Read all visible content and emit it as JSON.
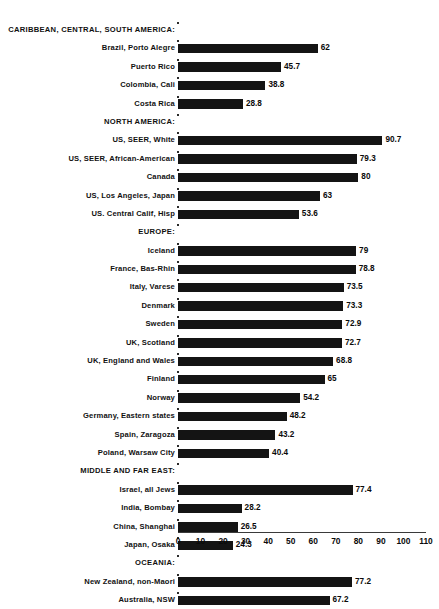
{
  "chart_data": {
    "type": "bar",
    "orientation": "horizontal",
    "title": "",
    "subtitle": "",
    "xlabel": "",
    "ylabel": "",
    "xlim": [
      0,
      110
    ],
    "xticks": [
      0,
      10,
      20,
      30,
      40,
      50,
      60,
      70,
      80,
      90,
      100,
      110
    ],
    "grid": false,
    "legend": "none",
    "bar_color": "#141414",
    "background_color": "#ffffff",
    "groups": [
      {
        "header": "CARIBBEAN, CENTRAL, SOUTH AMERICA:",
        "categories": [
          "Brazil, Porto Alegre",
          "Puerto Rico",
          "Colombia, Cali",
          "Costa Rica"
        ],
        "values": [
          62,
          45.7,
          38.8,
          28.8
        ],
        "value_labels": [
          "62",
          "45.7",
          "38.8",
          "28.8"
        ]
      },
      {
        "header": "NORTH AMERICA:",
        "categories": [
          "US, SEER, White",
          "US, SEER, African-American",
          "Canada",
          "US, Los Angeles, Japan",
          "US. Central Calif, Hisp"
        ],
        "values": [
          90.7,
          79.3,
          80,
          63,
          53.6
        ],
        "value_labels": [
          "90.7",
          "79.3",
          "80",
          "63",
          "53.6"
        ]
      },
      {
        "header": "EUROPE:",
        "categories": [
          "Iceland",
          "France, Bas-Rhin",
          "Italy, Varese",
          "Denmark",
          "Sweden",
          "UK, Scotland",
          "UK, England and Wales",
          "Finland",
          "Norway",
          "Germany, Eastern states",
          "Spain, Zaragoza",
          "Poland, Warsaw City"
        ],
        "values": [
          79,
          78.8,
          73.5,
          73.3,
          72.9,
          72.7,
          68.8,
          65,
          54.2,
          48.2,
          43.2,
          40.4
        ],
        "value_labels": [
          "79",
          "78.8",
          "73.5",
          "73.3",
          "72.9",
          "72.7",
          "68.8",
          "65",
          "54.2",
          "48.2",
          "43.2",
          "40.4"
        ]
      },
      {
        "header": "MIDDLE AND FAR EAST:",
        "categories": [
          "Israel, all Jews",
          "India, Bombay",
          "China, Shanghai",
          "Japan, Osaka"
        ],
        "values": [
          77.4,
          28.2,
          26.5,
          24.3
        ],
        "value_labels": [
          "77.4",
          "28.2",
          "26.5",
          "24.3"
        ]
      },
      {
        "header": "OCEANIA:",
        "categories": [
          "New Zealand, non-Maori",
          "Australia, NSW"
        ],
        "values": [
          77.2,
          67.2
        ],
        "value_labels": [
          "77.2",
          "67.2"
        ]
      }
    ]
  }
}
